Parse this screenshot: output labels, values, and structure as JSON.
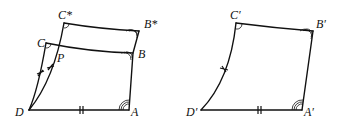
{
  "figures": [
    {
      "id": "left",
      "labels": {
        "C_star": "C*",
        "B_star": "B*",
        "C": "C",
        "P": "P",
        "B": "B",
        "D": "D",
        "A": "A"
      }
    },
    {
      "id": "right",
      "labels": {
        "C_prime": "C′",
        "B_prime": "B′",
        "D_prime": "D′",
        "A_prime": "A′"
      }
    }
  ]
}
